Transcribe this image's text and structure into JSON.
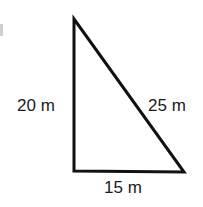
{
  "figure": {
    "type": "right-triangle",
    "stroke_color": "#111111",
    "stroke_width": 3,
    "vertices": {
      "top": [
        74,
        19
      ],
      "bottom_left": [
        74,
        171
      ],
      "bottom_right": [
        184,
        172
      ]
    },
    "right_angle_at": "bottom_left"
  },
  "labels": {
    "left_side": "20 m",
    "hypotenuse": "25 m",
    "bottom_side": "15 m"
  }
}
